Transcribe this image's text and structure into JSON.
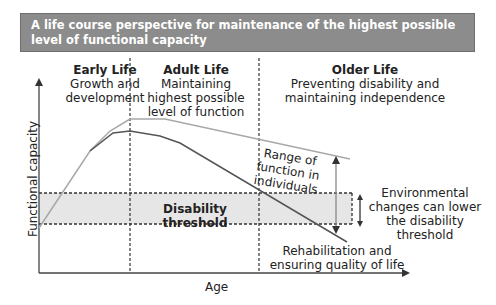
{
  "header": {
    "title": "A life course perspective for maintenance of the highest possible level of functional capacity"
  },
  "phases": [
    {
      "title": "Early Life",
      "description": "Growth and development"
    },
    {
      "title": "Adult Life",
      "description": "Maintaining highest possible level of function"
    },
    {
      "title": "Older Life",
      "description": "Preventing disability and maintaining independence"
    }
  ],
  "axes": {
    "y_label": "Functional capacity",
    "x_label": "Age"
  },
  "annotations": {
    "threshold": "Disability threshold",
    "range": "Range of function in individuals",
    "environment": "Environmental changes can lower the disability threshold",
    "rehab": "Rehabilitation and ensuring quality of life"
  },
  "colors": {
    "header_bg": "#8c8c8c",
    "threshold_band": "#e6e6e6",
    "upper_line": "#a8a8a8",
    "lower_line": "#555555"
  }
}
